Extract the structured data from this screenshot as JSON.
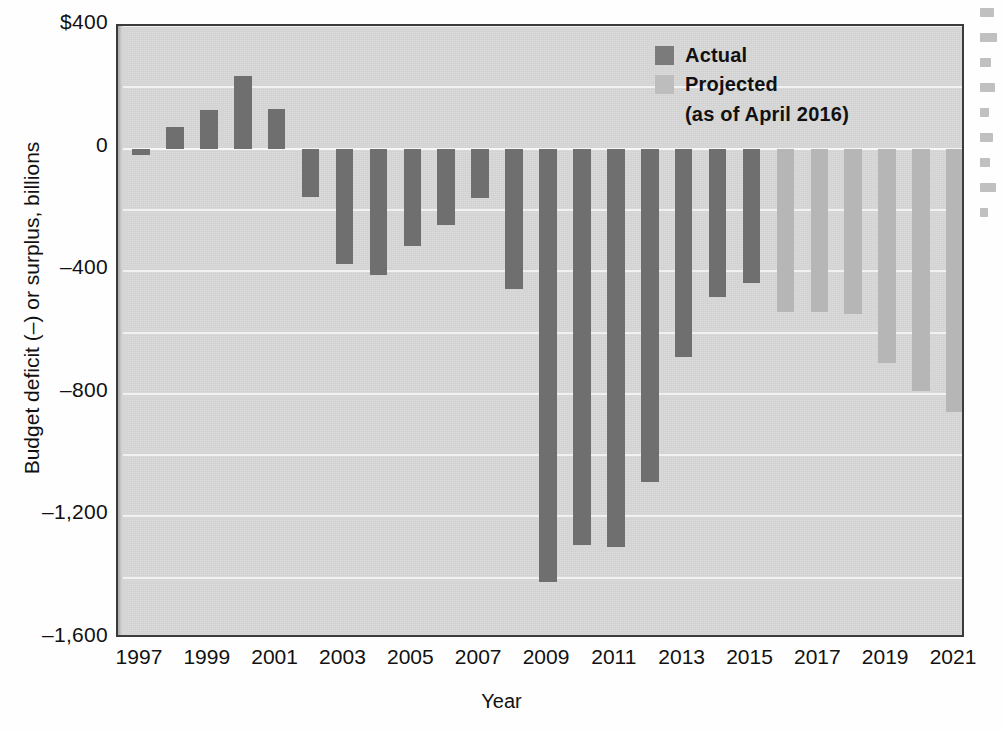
{
  "chart_data": {
    "type": "bar",
    "title": "",
    "xlabel": "Year",
    "ylabel": "Budget deficit (–) or surplus, billions",
    "ylim": [
      -1600,
      400
    ],
    "grid": true,
    "legend_position": "top-right",
    "y_ticks": [
      "$400",
      "0",
      "–400",
      "–800",
      "–1,200",
      "–1,600"
    ],
    "y_tick_values": [
      400,
      0,
      -400,
      -800,
      -1200,
      -1600
    ],
    "x_tick_labels": [
      "1997",
      "1999",
      "2001",
      "2003",
      "2005",
      "2007",
      "2009",
      "2011",
      "2013",
      "2015",
      "2017",
      "2019",
      "2021"
    ],
    "categories": [
      "1997",
      "1998",
      "1999",
      "2000",
      "2001",
      "2002",
      "2003",
      "2004",
      "2005",
      "2006",
      "2007",
      "2008",
      "2009",
      "2010",
      "2011",
      "2012",
      "2013",
      "2014",
      "2015",
      "2016",
      "2017",
      "2018",
      "2019",
      "2020",
      "2021"
    ],
    "values": [
      -22,
      69,
      126,
      236,
      128,
      -158,
      -378,
      -413,
      -318,
      -248,
      -161,
      -459,
      -1413,
      -1294,
      -1300,
      -1087,
      -680,
      -485,
      -438,
      -534,
      -534,
      -539,
      -700,
      -790,
      -860
    ],
    "series_of": [
      "Actual",
      "Actual",
      "Actual",
      "Actual",
      "Actual",
      "Actual",
      "Actual",
      "Actual",
      "Actual",
      "Actual",
      "Actual",
      "Actual",
      "Actual",
      "Actual",
      "Actual",
      "Actual",
      "Actual",
      "Actual",
      "Actual",
      "Projected",
      "Projected",
      "Projected",
      "Projected",
      "Projected",
      "Projected"
    ],
    "series": [
      {
        "name": "Actual",
        "color": "#6f6f6f"
      },
      {
        "name": "Projected",
        "color": "#b6b6b6"
      }
    ]
  },
  "legend": {
    "actual_label": "Actual",
    "projected_label": "Projected",
    "projected_note": "(as of April 2016)"
  },
  "colors": {
    "actual": "#6f6f6f",
    "projected": "#b6b6b6",
    "plot_background": "#d9d9d9",
    "gridline": "#f2f2f2",
    "frame": "#3b3b3b",
    "text": "#111111"
  }
}
